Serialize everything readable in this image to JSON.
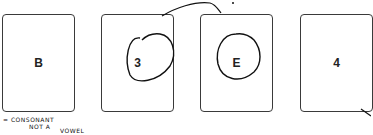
{
  "cards": [
    {
      "id": "card-b",
      "label": "B",
      "circled": false
    },
    {
      "id": "card-3",
      "label": "3",
      "circled": true
    },
    {
      "id": "card-e",
      "label": "E",
      "circled": true
    },
    {
      "id": "card-4",
      "label": "4",
      "circled": false
    }
  ],
  "annotation": {
    "line1": "= CONSONANT",
    "line2": "NOT A",
    "line3": "VOWEL"
  },
  "colors": {
    "ink": "#111111",
    "card_border": "#3a3a3a"
  }
}
